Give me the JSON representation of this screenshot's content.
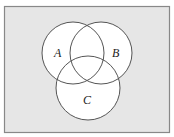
{
  "diagram": {
    "type": "venn",
    "background_color": "#e6e6e6",
    "border_color": "#888888",
    "circle_fill": "#ffffff",
    "circle_stroke": "#555555",
    "sets": [
      {
        "label": "A",
        "cx": 73,
        "cy": 53,
        "r": 31,
        "label_x": 58,
        "label_y": 57
      },
      {
        "label": "B",
        "cx": 101,
        "cy": 53,
        "r": 31,
        "label_x": 116,
        "label_y": 57
      },
      {
        "label": "C",
        "cx": 88,
        "cy": 88,
        "r": 32,
        "label_x": 87,
        "label_y": 104
      }
    ]
  }
}
